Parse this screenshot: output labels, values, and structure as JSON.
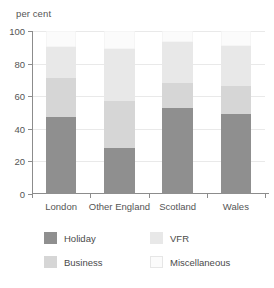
{
  "chart_data": {
    "type": "bar",
    "subtype": "stacked-bar",
    "title": "",
    "xlabel": "",
    "ylabel": "per cent",
    "ylim": [
      0,
      100
    ],
    "yticks": [
      0,
      20,
      40,
      60,
      80,
      100
    ],
    "grid": true,
    "legend_position": "bottom",
    "categories": [
      "London",
      "Other England",
      "Scotland",
      "Wales"
    ],
    "series": [
      {
        "name": "Holiday",
        "color": "#8f8f8f",
        "values": [
          47,
          28,
          53,
          49
        ]
      },
      {
        "name": "Business",
        "color": "#d6d6d6",
        "values": [
          24,
          29,
          15,
          17
        ]
      },
      {
        "name": "VFR",
        "color": "#e8e8e8",
        "values": [
          19,
          32,
          25,
          25
        ]
      },
      {
        "name": "Miscellaneous",
        "color": "#fbfbfb",
        "values": [
          10,
          11,
          7,
          9
        ]
      }
    ],
    "cumulative_tops": {
      "London": [
        47,
        71,
        90,
        100
      ],
      "Other England": [
        28,
        57,
        89,
        100
      ],
      "Scotland": [
        53,
        68,
        93,
        100
      ],
      "Wales": [
        49,
        66,
        91,
        100
      ]
    }
  },
  "axis": {
    "y_title": "per cent",
    "tick_labels": [
      "0",
      "20",
      "40",
      "60",
      "80",
      "100"
    ]
  },
  "legend": {
    "items": [
      {
        "label": "Holiday",
        "color": "#8f8f8f"
      },
      {
        "label": "VFR",
        "color": "#e8e8e8"
      },
      {
        "label": "Business",
        "color": "#d6d6d6"
      },
      {
        "label": "Miscellaneous",
        "color": "#fbfbfb"
      }
    ]
  }
}
